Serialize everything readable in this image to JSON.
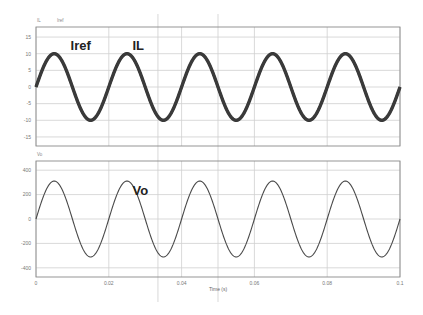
{
  "chart_data": [
    {
      "type": "line",
      "panel": "top",
      "legend": [
        "IL",
        "Iref"
      ],
      "annotations": [
        {
          "text": "Iref",
          "t": 0.0095,
          "v": 10
        },
        {
          "text": "IL",
          "t": 0.0265,
          "v": 10
        }
      ],
      "xlabel": "",
      "ylabel": "",
      "xlim": [
        0,
        0.1
      ],
      "ylim": [
        -18,
        18
      ],
      "yticks": [
        15,
        10,
        5,
        0,
        -5,
        -10,
        -15
      ],
      "series": [
        {
          "name": "Iref",
          "waveform": "sine",
          "amplitude": 10,
          "frequency_hz": 50,
          "phase_deg": 0
        },
        {
          "name": "IL",
          "waveform": "sine",
          "amplitude": 10,
          "frequency_hz": 50,
          "phase_deg": 0
        }
      ],
      "grid": true
    },
    {
      "type": "line",
      "panel": "bottom",
      "legend": [
        "Vo"
      ],
      "annotations": [
        {
          "text": "Vo",
          "t": 0.0265,
          "v": 200
        }
      ],
      "xlabel": "Time (s)",
      "ylabel": "",
      "xlim": [
        0,
        0.1
      ],
      "ylim": [
        -470,
        470
      ],
      "yticks": [
        400,
        200,
        0,
        -200,
        -400
      ],
      "xticks": [
        0,
        0.02,
        0.04,
        0.06,
        0.08,
        0.1
      ],
      "xtick_labels": [
        "0",
        "0.02",
        "0.04",
        "0.06",
        "0.08",
        "0.1"
      ],
      "series": [
        {
          "name": "Vo",
          "waveform": "sine",
          "amplitude": 311,
          "frequency_hz": 50,
          "phase_deg": 0
        }
      ],
      "grid": true
    }
  ],
  "cursors": [
    0.0335,
    0.05
  ],
  "labels": {
    "top_legend_il": "IL",
    "top_legend_iref": "Iref",
    "bottom_legend_vo": "Vo",
    "annot_iref": "Iref",
    "annot_il": "IL",
    "annot_vo": "Vo",
    "xlabel": "Time (s)"
  },
  "colors": {
    "trace_top": "#3a3a3a",
    "trace_bottom": "#4a4a4a",
    "grid": "#cfcfcf",
    "frame": "#8a8a8a",
    "cursor": "#c8c8c8"
  }
}
